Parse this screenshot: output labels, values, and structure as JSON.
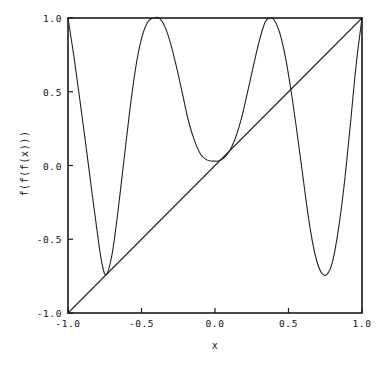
{
  "chart_data": {
    "type": "line",
    "title": "",
    "subtitle": "",
    "xlabel": "x",
    "ylabel": "f(f(f(x)))",
    "xlim": [
      -1.0,
      1.0
    ],
    "ylim": [
      -1.0,
      1.0
    ],
    "grid": false,
    "legend": null,
    "legend_position": "none",
    "xticks": [
      -1.0,
      -0.5,
      0.0,
      0.5,
      1.0
    ],
    "xtick_labels": [
      "-1.0",
      "-0.5",
      "0.0",
      "0.5",
      "1.0"
    ],
    "yticks": [
      -1.0,
      -0.5,
      0.0,
      0.5,
      1.0
    ],
    "ytick_labels": [
      "-1.0",
      "-0.5",
      "0.0",
      "0.5",
      "1.0"
    ],
    "series": [
      {
        "name": "f(f(f(x)))",
        "color": "#222222",
        "linewidth": 1,
        "comment": "Thrice-iterated unimodal map; two interior maxima reach 1.0 and three interior minima near -0.74, 0.03, -0.74",
        "x": [
          -1.0,
          -0.96,
          -0.92,
          -0.88,
          -0.84,
          -0.8,
          -0.77,
          -0.74,
          -0.7,
          -0.66,
          -0.62,
          -0.58,
          -0.54,
          -0.5,
          -0.46,
          -0.42,
          -0.38,
          -0.34,
          -0.3,
          -0.26,
          -0.22,
          -0.18,
          -0.14,
          -0.1,
          -0.06,
          -0.02,
          0.0,
          0.02,
          0.06,
          0.1,
          0.14,
          0.18,
          0.22,
          0.26,
          0.3,
          0.34,
          0.37,
          0.4,
          0.44,
          0.48,
          0.52,
          0.56,
          0.6,
          0.64,
          0.68,
          0.72,
          0.76,
          0.8,
          0.84,
          0.88,
          0.92,
          0.96,
          1.0
        ],
        "y": [
          1.0,
          0.74,
          0.45,
          0.15,
          -0.16,
          -0.46,
          -0.66,
          -0.74,
          -0.6,
          -0.31,
          0.03,
          0.37,
          0.66,
          0.86,
          0.97,
          1.0,
          1.0,
          0.94,
          0.82,
          0.66,
          0.48,
          0.3,
          0.17,
          0.08,
          0.04,
          0.03,
          0.03,
          0.03,
          0.05,
          0.1,
          0.19,
          0.32,
          0.49,
          0.67,
          0.84,
          0.97,
          1.0,
          0.99,
          0.9,
          0.73,
          0.49,
          0.21,
          -0.09,
          -0.38,
          -0.6,
          -0.72,
          -0.74,
          -0.65,
          -0.43,
          -0.12,
          0.27,
          0.68,
          1.0
        ]
      },
      {
        "name": "y = x",
        "color": "#222222",
        "linewidth": 1,
        "comment": "Identity diagonal used to locate fixed points",
        "x": [
          -1.0,
          1.0
        ],
        "y": [
          -1.0,
          1.0
        ]
      }
    ],
    "annotations": {
      "maxima_x": [
        -0.38,
        0.37
      ],
      "maxima_y": [
        1.0,
        1.0
      ],
      "minima_x": [
        -0.77,
        0.0,
        0.76
      ],
      "minima_y": [
        -0.74,
        0.03,
        -0.74
      ],
      "endpoints": [
        {
          "x": -1.0,
          "y": 1.0
        },
        {
          "x": 1.0,
          "y": 1.0
        }
      ]
    }
  },
  "axes": {
    "xlabel": "x",
    "ylabel": "f(f(f(x)))",
    "xtick_labels": [
      "-1.0",
      "-0.5",
      "0.0",
      "0.5",
      "1.0"
    ],
    "ytick_labels": [
      "1.0",
      "0.5",
      "0.0",
      "-0.5",
      "-1.0"
    ],
    "frame_color": "#1a1a1a",
    "background": "#ffffff"
  }
}
